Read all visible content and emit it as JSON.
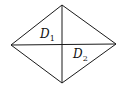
{
  "diagram": {
    "shape": "rhombus",
    "vertices": {
      "left": [
        11,
        45
      ],
      "top": [
        62,
        5
      ],
      "right": [
        116,
        44
      ],
      "bottom": [
        62,
        83
      ]
    },
    "stroke_color": "#1a1a1a",
    "labels": [
      {
        "text": "D",
        "subscript": "1",
        "position": [
          40,
          38
        ]
      },
      {
        "text": "D",
        "subscript": "2",
        "position": [
          73,
          58
        ]
      }
    ]
  }
}
